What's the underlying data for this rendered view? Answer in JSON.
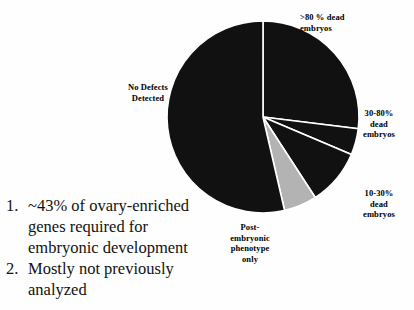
{
  "chart_data": {
    "type": "pie",
    "title": "",
    "categories": [
      ">80 % dead embryos",
      "30-80% dead embryos",
      "10-30% dead embryos",
      "Post-embryonic phenotype only",
      "No Defects Detected"
    ],
    "values": [
      27,
      4.5,
      9.5,
      5.5,
      53.5
    ],
    "value_unit": "percent",
    "start_angle_deg": 0,
    "direction": "clockwise",
    "colors": [
      "#111111",
      "#111111",
      "#111111",
      "#b3b3b3",
      "#111111"
    ],
    "slice_edge_color": "#ffffff",
    "legend": "none",
    "labels_position": "outside",
    "slices": [
      {
        "label": ">80 % dead embryos",
        "label_lines": [
          ">80 % dead",
          "embryos"
        ],
        "start_deg": 0,
        "end_deg": 97,
        "fill": "#111111"
      },
      {
        "label": "30-80% dead embryos",
        "label_lines": [
          "30-80%",
          "dead",
          "embryos"
        ],
        "start_deg": 97,
        "end_deg": 113,
        "fill": "#111111"
      },
      {
        "label": "10-30% dead embryos",
        "label_lines": [
          "10-30%",
          "dead",
          "embryos"
        ],
        "start_deg": 113,
        "end_deg": 147,
        "fill": "#111111"
      },
      {
        "label": "Post-embryonic phenotype only",
        "label_lines": [
          "Post-",
          "embryonic",
          "phenotype",
          "only"
        ],
        "start_deg": 147,
        "end_deg": 167,
        "fill": "#b3b3b3"
      },
      {
        "label": "No Defects Detected",
        "label_lines": [
          "No Defects",
          "Detected"
        ],
        "start_deg": 167,
        "end_deg": 360,
        "fill": "#111111"
      }
    ]
  },
  "labels": {
    "gt80": ">80 % dead\nembryos",
    "mid3080": "30-80%\ndead\nembryos",
    "low1030": "10-30%\ndead\nembryos",
    "postembryonic": "Post-\nembryonic\nphenotype\nonly",
    "nodefects": "No Defects\nDetected"
  },
  "notes": [
    {
      "number": "1.",
      "text": "~43% of ovary-enriched genes required for embryonic development"
    },
    {
      "number": "2.",
      "text": "Mostly not previously analyzed"
    }
  ]
}
